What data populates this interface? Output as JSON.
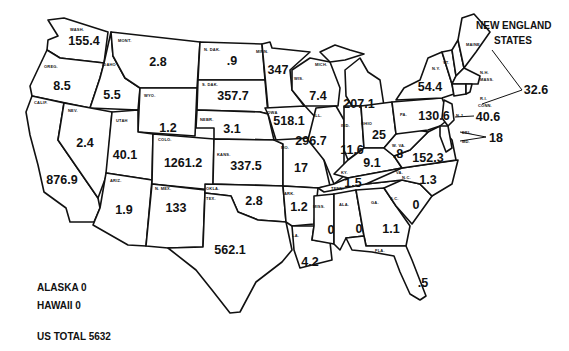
{
  "title_line1": "NEW ENGLAND",
  "title_line2": "STATES",
  "states": [
    {
      "abbr": "WASH.",
      "value": "155.4"
    },
    {
      "abbr": "OREG.",
      "value": "8.5"
    },
    {
      "abbr": "CALIF.",
      "value": "876.9"
    },
    {
      "abbr": "IDAHO",
      "value": "5.5"
    },
    {
      "abbr": "NEV.",
      "value": "2.4"
    },
    {
      "abbr": "MONT.",
      "value": "2.8"
    },
    {
      "abbr": "WYO.",
      "value": "1.2"
    },
    {
      "abbr": "UTAH",
      "value": "40.1"
    },
    {
      "abbr": "ARIZ.",
      "value": "1.9"
    },
    {
      "abbr": "COLO.",
      "value": "1261.2"
    },
    {
      "abbr": "N. MEX.",
      "value": "133"
    },
    {
      "abbr": "N. DAK.",
      "value": ".9"
    },
    {
      "abbr": "S. DAK.",
      "value": "357.7"
    },
    {
      "abbr": "NEBR.",
      "value": "3.1"
    },
    {
      "abbr": "KANS.",
      "value": "337.5"
    },
    {
      "abbr": "OKLA.",
      "value": "2.8"
    },
    {
      "abbr": "TEX.",
      "value": "562.1"
    },
    {
      "abbr": "MINN.",
      "value": "347"
    },
    {
      "abbr": "IOWA",
      "value": "518.1"
    },
    {
      "abbr": "MO.",
      "value": "17"
    },
    {
      "abbr": "ARK.",
      "value": "1.2"
    },
    {
      "abbr": "LA.",
      "value": "4.2"
    },
    {
      "abbr": "WIS.",
      "value": "7.4"
    },
    {
      "abbr": "ILL.",
      "value": "296.7"
    },
    {
      "abbr": "MICH.",
      "value": "207.1"
    },
    {
      "abbr": "IND.",
      "value": "11.6"
    },
    {
      "abbr": "OHIO",
      "value": "25"
    },
    {
      "abbr": "KY.",
      "value": "9.1"
    },
    {
      "abbr": "TENN.",
      "value": "1.5"
    },
    {
      "abbr": "MISS.",
      "value": "0"
    },
    {
      "abbr": "ALA.",
      "value": "0"
    },
    {
      "abbr": "GA.",
      "value": "1.1"
    },
    {
      "abbr": "FLA.",
      "value": ".5"
    },
    {
      "abbr": "S.C.",
      "value": "0"
    },
    {
      "abbr": "N.C.",
      "value": "1.3"
    },
    {
      "abbr": "VA.",
      "value": "152.3"
    },
    {
      "abbr": "W. VA.",
      "value": ".8"
    },
    {
      "abbr": "PA.",
      "value": "130.6"
    },
    {
      "abbr": "N.Y.",
      "value": "54.4"
    },
    {
      "abbr": "N.J.",
      "value": "40.6"
    },
    {
      "abbr": "DEL./MD.",
      "value": "18"
    },
    {
      "abbr": "MAINE/N.H./VT./MASS./R.I./CONN.",
      "value": "32.6"
    }
  ],
  "ne_abbr": {
    "maine": "MAINE",
    "vt": "VT.",
    "nh": "N.H.",
    "mass": "MASS.",
    "ri": "R.I.",
    "conn": "CONN.",
    "nj": "N.J.",
    "del": "DEL.",
    "md": "MD."
  },
  "alaska_label": "ALASKA",
  "alaska_value": "0",
  "hawaii_label": "HAWAII",
  "hawaii_value": "0",
  "total_label": "US TOTAL",
  "total_value": "5632"
}
